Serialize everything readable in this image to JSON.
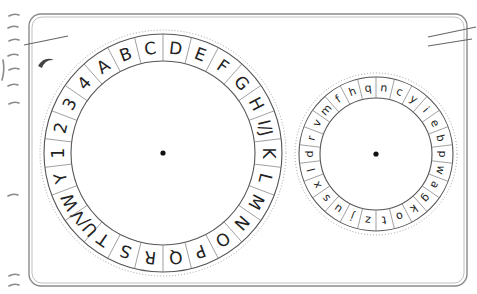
{
  "large_wheel": {
    "center": [
      163,
      153
    ],
    "outer_radius": 119,
    "inner_radius": 92,
    "dotted_radius": 123,
    "start_angle_deg": 0,
    "labels": [
      "D",
      "E",
      "F",
      "G",
      "H",
      "I/J",
      "K",
      "L",
      "M",
      "N",
      "O",
      "P",
      "Q",
      "R",
      "S",
      "T",
      "U/V",
      "W",
      "Y",
      "1",
      "2",
      "3",
      "4",
      "A",
      "B",
      "C"
    ]
  },
  "small_wheel": {
    "center": [
      376,
      154
    ],
    "outer_radius": 77,
    "inner_radius": 56,
    "dotted_radius": 81,
    "start_angle_deg": 0,
    "labels": [
      "n",
      "c",
      "y",
      "i",
      "e",
      "b",
      "p",
      "w",
      "a",
      "g",
      "k",
      "o",
      "t",
      "z",
      "j",
      "u",
      "s",
      "x",
      "l",
      "d",
      "r",
      "v",
      "m",
      "f",
      "h",
      "q"
    ]
  },
  "colors": {
    "line": "#555555",
    "frame": "#777777",
    "dot": "#111111",
    "text": "#222222"
  }
}
